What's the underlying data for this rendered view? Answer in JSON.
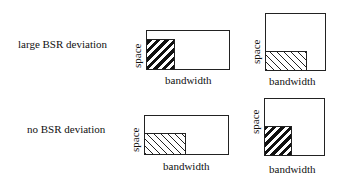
{
  "rows": [
    {
      "label": "large BSR deviation",
      "panels": [
        {
          "x_label": "bandwidth",
          "y_label": "space",
          "hatch": "thick-forward",
          "shape": "wide"
        },
        {
          "x_label": "bandwidth",
          "y_label": "space",
          "hatch": "thin-backward",
          "shape": "tall"
        }
      ]
    },
    {
      "label": "no BSR deviation",
      "panels": [
        {
          "x_label": "bandwidth",
          "y_label": "space",
          "hatch": "thin-backward",
          "shape": "wide"
        },
        {
          "x_label": "bandwidth",
          "y_label": "space",
          "hatch": "thick-forward",
          "shape": "tall"
        }
      ]
    }
  ]
}
